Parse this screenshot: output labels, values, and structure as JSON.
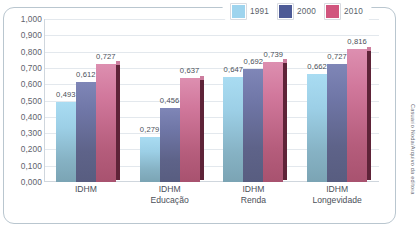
{
  "chart_data": {
    "type": "bar",
    "title": "",
    "xlabel": "",
    "ylabel": "",
    "ylim": [
      0,
      1.0
    ],
    "grid": true,
    "legend_position": "top-right",
    "categories": [
      "IDHM",
      "IDHM Educação",
      "IDHM Renda",
      "IDHM Longevidade"
    ],
    "category_lines": [
      [
        "IDHM",
        ""
      ],
      [
        "IDHM",
        "Educação"
      ],
      [
        "IDHM",
        "Renda"
      ],
      [
        "IDHM",
        "Longevidade"
      ]
    ],
    "series": [
      {
        "name": "1991",
        "color": "#9ed4ee",
        "values": [
          0.493,
          0.279,
          0.647,
          0.662
        ],
        "labels": [
          "0,493",
          "0,279",
          "0,647",
          "0,662"
        ]
      },
      {
        "name": "2000",
        "color": "#4d5a96",
        "values": [
          0.612,
          0.456,
          0.692,
          0.727
        ],
        "labels": [
          "0,612",
          "0,456",
          "0,692",
          "0,727"
        ]
      },
      {
        "name": "2010",
        "color": "#d1557e",
        "values": [
          0.727,
          0.637,
          0.739,
          0.816
        ],
        "labels": [
          "0,727",
          "0,637",
          "0,739",
          "0,816"
        ]
      }
    ],
    "ytick_labels": [
      "1,000",
      "0,900",
      "0,800",
      "0,700",
      "0,600",
      "0,500",
      "0,400",
      "0,300",
      "0,200",
      "0,100",
      "0,000"
    ],
    "ytick_values": [
      1.0,
      0.9,
      0.8,
      0.7,
      0.6,
      0.5,
      0.4,
      0.3,
      0.2,
      0.1,
      0.0
    ]
  },
  "legend": {
    "items": [
      {
        "label": "1991"
      },
      {
        "label": "2000"
      },
      {
        "label": "2010"
      }
    ]
  },
  "credit": {
    "text": "Casuario Noda/Arquivo da editora"
  }
}
